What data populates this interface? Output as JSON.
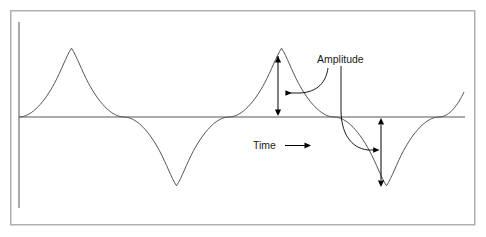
{
  "figure": {
    "title": "",
    "type": "waveform-diagram",
    "background_color": "#ffffff",
    "border": {
      "color": "#b0b0b0",
      "x": 10,
      "y": 10,
      "width": 465,
      "height": 215,
      "stroke_width": 1.5
    },
    "axes": {
      "vertical_axis": {
        "label": "",
        "color": "#9a9a9a",
        "x": 19,
        "y_top": 22,
        "y_bottom": 208,
        "stroke_width": 1.6
      },
      "horizontal_axis": {
        "label": "Time",
        "color": "#8f8f8f",
        "y": 117,
        "x_start": 19,
        "x_end": 465,
        "stroke_width": 1.6
      }
    },
    "wave": {
      "color": "#55555a",
      "stroke_width": 0.9,
      "shape": "sine",
      "amplitude_px": 69,
      "period_px": 210,
      "x_start": 19,
      "x_end": 465,
      "baseline_y": 117,
      "peaks": [
        {
          "x": 71,
          "y": 48
        },
        {
          "x": 278,
          "y": 48
        }
      ],
      "troughs": [
        {
          "x": 176,
          "y": 186
        },
        {
          "x": 383,
          "y": 186
        }
      ],
      "zero_crossings": [
        19,
        124,
        229,
        331,
        433
      ]
    },
    "annotations": {
      "amplitude": {
        "label": "Amplitude",
        "text_x": 317,
        "text_y": 63,
        "color": "#1a1a1a",
        "upper_measure": {
          "name": "peak-amplitude-arrow",
          "x": 278,
          "y_top": 50,
          "y_bottom": 116,
          "double_headed": true,
          "color": "#000000"
        },
        "lower_measure": {
          "name": "trough-amplitude-arrow",
          "x": 381,
          "y_top": 118,
          "y_bottom": 186,
          "double_headed": true,
          "color": "#000000"
        },
        "leader_upper": {
          "name": "amplitude-leader-upper",
          "arrow_tip_x": 279,
          "arrow_tip_y": 93,
          "color": "#000000"
        },
        "leader_lower": {
          "name": "amplitude-leader-lower",
          "arrow_tip_x": 380,
          "arrow_tip_y": 150,
          "color": "#000000"
        }
      },
      "time": {
        "label": "Time",
        "text_x": 253,
        "text_y": 149,
        "color": "#1a1a1a",
        "arrow": {
          "name": "time-direction-arrow",
          "x_start": 285,
          "x_end": 310,
          "y": 146,
          "color": "#000000"
        }
      }
    }
  }
}
